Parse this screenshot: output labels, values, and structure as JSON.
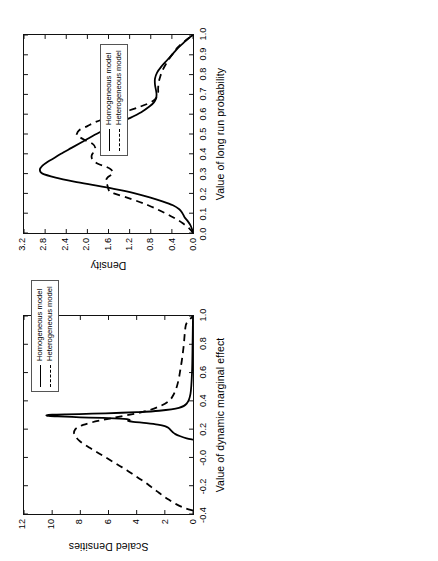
{
  "figure": {
    "orientation": "rotated-90-ccw",
    "background": "#ffffff",
    "line_color": "#000000"
  },
  "legend": {
    "homogeneous": "Homogeneous model",
    "heterogeneous": "Heterogeneous model"
  },
  "chart_data": [
    {
      "id": "panel-top",
      "type": "line",
      "title": "",
      "xlabel": "Value of dynamic marginal effect",
      "ylabel": "Scaled Densities",
      "xlim": [
        -0.4,
        1.0
      ],
      "ylim": [
        0,
        12
      ],
      "xticks": [
        "-0.4",
        "-0.2",
        "-0.0",
        "0.2",
        "0.4",
        "0.6",
        "0.8",
        "1.0"
      ],
      "xtick_values": [
        -0.4,
        -0.2,
        0.0,
        0.2,
        0.4,
        0.6,
        0.8,
        1.0
      ],
      "yticks": [
        "0",
        "2",
        "4",
        "6",
        "8",
        "10",
        "12"
      ],
      "ytick_values": [
        0,
        2,
        4,
        6,
        8,
        10,
        12
      ],
      "grid": false,
      "legend_position": "top-right",
      "series": [
        {
          "name": "Homogeneous model",
          "style": "solid",
          "x": [
            0.125,
            0.135,
            0.15,
            0.165,
            0.18,
            0.195,
            0.21,
            0.222,
            0.232,
            0.242,
            0.252,
            0.258,
            0.263,
            0.268,
            0.272,
            0.276,
            0.279,
            0.282,
            0.286,
            0.29,
            0.294,
            0.298,
            0.302,
            0.305,
            0.308,
            0.312,
            0.32,
            0.33,
            0.35,
            0.38,
            0.45,
            0.6,
            0.8,
            1.0
          ],
          "y": [
            0.0,
            0.45,
            0.9,
            1.25,
            1.45,
            1.6,
            1.75,
            2.0,
            2.5,
            3.3,
            4.25,
            4.6,
            4.5,
            4.55,
            4.9,
            5.6,
            6.4,
            7.4,
            8.6,
            9.6,
            10.25,
            10.4,
            10.0,
            9.0,
            7.6,
            6.2,
            4.0,
            2.4,
            1.0,
            0.45,
            0.18,
            0.07,
            0.03,
            0.0
          ]
        },
        {
          "name": "Heterogeneous model",
          "style": "dashed",
          "x": [
            -0.375,
            -0.36,
            -0.33,
            -0.3,
            -0.27,
            -0.24,
            -0.21,
            -0.18,
            -0.15,
            -0.12,
            -0.09,
            -0.06,
            -0.03,
            0.0,
            0.03,
            0.06,
            0.09,
            0.12,
            0.15,
            0.175,
            0.2,
            0.215,
            0.23,
            0.245,
            0.26,
            0.275,
            0.29,
            0.31,
            0.33,
            0.36,
            0.4,
            0.45,
            0.5,
            0.56,
            0.62,
            0.68,
            0.74,
            0.8,
            0.86,
            0.91,
            0.95,
            1.0
          ],
          "y": [
            0.0,
            0.55,
            1.2,
            1.7,
            2.15,
            2.55,
            2.95,
            3.35,
            3.8,
            4.25,
            4.7,
            5.2,
            5.7,
            6.2,
            6.7,
            7.2,
            7.7,
            8.1,
            8.35,
            8.45,
            8.35,
            8.15,
            7.8,
            7.3,
            6.65,
            5.9,
            5.1,
            4.1,
            3.25,
            2.4,
            1.7,
            1.35,
            1.15,
            1.0,
            0.9,
            0.8,
            0.72,
            0.65,
            0.6,
            0.55,
            0.45,
            0.0
          ]
        }
      ]
    },
    {
      "id": "panel-bottom",
      "type": "line",
      "title": "",
      "xlabel": "Value of long run probability",
      "ylabel": "Density",
      "xlim": [
        0.0,
        1.0
      ],
      "ylim": [
        0.0,
        3.2
      ],
      "xticks": [
        "0.0",
        "0.1",
        "0.2",
        "0.3",
        "0.4",
        "0.5",
        "0.6",
        "0.7",
        "0.8",
        "0.9",
        "1.0"
      ],
      "xtick_values": [
        0.0,
        0.1,
        0.2,
        0.3,
        0.4,
        0.5,
        0.6,
        0.7,
        0.8,
        0.9,
        1.0
      ],
      "yticks": [
        "0.0",
        "0.4",
        "0.8",
        "1.2",
        "1.6",
        "2.0",
        "2.4",
        "2.8",
        "3.2"
      ],
      "ytick_values": [
        0.0,
        0.4,
        0.8,
        1.2,
        1.6,
        2.0,
        2.4,
        2.8,
        3.2
      ],
      "grid": false,
      "legend_position": "upper-middle",
      "series": [
        {
          "name": "Homogeneous model",
          "style": "solid",
          "x": [
            0.0,
            0.02,
            0.04,
            0.06,
            0.08,
            0.1,
            0.12,
            0.14,
            0.16,
            0.18,
            0.2,
            0.22,
            0.24,
            0.26,
            0.28,
            0.3,
            0.32,
            0.34,
            0.36,
            0.38,
            0.4,
            0.43,
            0.46,
            0.49,
            0.52,
            0.55,
            0.58,
            0.61,
            0.64,
            0.66,
            0.68,
            0.7,
            0.72,
            0.75,
            0.78,
            0.81,
            0.84,
            0.87,
            0.9,
            0.93,
            0.96,
            0.98,
            1.0
          ],
          "y": [
            0.0,
            0.02,
            0.05,
            0.1,
            0.16,
            0.2,
            0.26,
            0.38,
            0.58,
            0.82,
            1.1,
            1.45,
            1.85,
            2.25,
            2.6,
            2.85,
            2.9,
            2.85,
            2.75,
            2.62,
            2.5,
            2.3,
            2.1,
            1.9,
            1.68,
            1.45,
            1.2,
            0.98,
            0.82,
            0.74,
            0.7,
            0.69,
            0.7,
            0.72,
            0.72,
            0.68,
            0.6,
            0.5,
            0.4,
            0.3,
            0.18,
            0.1,
            0.0
          ]
        },
        {
          "name": "Heterogeneous model",
          "style": "dashed",
          "x": [
            0.0,
            0.02,
            0.05,
            0.08,
            0.11,
            0.14,
            0.17,
            0.2,
            0.205,
            0.21,
            0.22,
            0.24,
            0.26,
            0.28,
            0.3,
            0.32,
            0.335,
            0.35,
            0.37,
            0.39,
            0.41,
            0.43,
            0.45,
            0.47,
            0.49,
            0.5,
            0.52,
            0.54,
            0.56,
            0.58,
            0.6,
            0.62,
            0.64,
            0.66,
            0.675,
            0.69,
            0.71,
            0.73,
            0.76,
            0.79,
            0.82,
            0.85,
            0.88,
            0.91,
            0.94,
            0.97,
            1.0
          ],
          "y": [
            0.0,
            0.06,
            0.2,
            0.38,
            0.6,
            0.85,
            1.15,
            1.5,
            1.55,
            1.58,
            1.6,
            1.62,
            1.65,
            1.62,
            1.52,
            1.55,
            1.65,
            1.8,
            1.9,
            1.92,
            1.88,
            1.85,
            1.9,
            2.05,
            2.18,
            2.2,
            2.15,
            2.0,
            1.85,
            1.65,
            1.45,
            1.2,
            0.98,
            0.8,
            0.72,
            0.68,
            0.66,
            0.66,
            0.65,
            0.62,
            0.58,
            0.52,
            0.45,
            0.37,
            0.28,
            0.15,
            0.0
          ]
        }
      ]
    }
  ]
}
